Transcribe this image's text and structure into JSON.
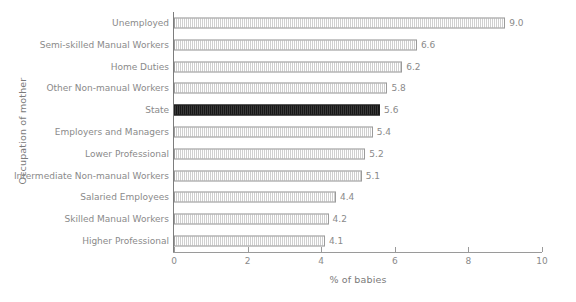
{
  "chart_data": {
    "type": "bar",
    "orientation": "horizontal",
    "title": "",
    "xlabel": "% of babies",
    "ylabel": "Occupation of mother",
    "xlim": [
      0,
      10
    ],
    "xticks": [
      0,
      2,
      4,
      6,
      8,
      10
    ],
    "xtick_labels": [
      "0",
      "2",
      "4",
      "6",
      "8",
      "10"
    ],
    "grid": false,
    "legend": null,
    "categories": [
      "Unemployed",
      "Semi-skilled Manual Workers",
      "Home Duties",
      "Other Non-manual Workers",
      "State",
      "Employers and Managers",
      "Lower Professional",
      "Intermediate Non-manual Workers",
      "Salaried Employees",
      "Skilled Manual Workers",
      "Higher Professional"
    ],
    "values": [
      9.0,
      6.6,
      6.2,
      5.8,
      5.6,
      5.4,
      5.2,
      5.1,
      4.4,
      4.2,
      4.1
    ],
    "value_labels": [
      "9.0",
      "6.6",
      "6.2",
      "5.8",
      "5.6",
      "5.4",
      "5.2",
      "5.1",
      "4.4",
      "4.2",
      "4.1"
    ],
    "highlight_category": "State",
    "highlight_index": 4,
    "colors": {
      "bar_fill": "#e8e8e8",
      "bar_border": "#9b9b9b",
      "highlight_fill": "#232323",
      "highlight_border": "#1d1d1d",
      "text": "#8a8a8a",
      "axis": "#9a9a9a",
      "background": "#ffffff"
    }
  }
}
